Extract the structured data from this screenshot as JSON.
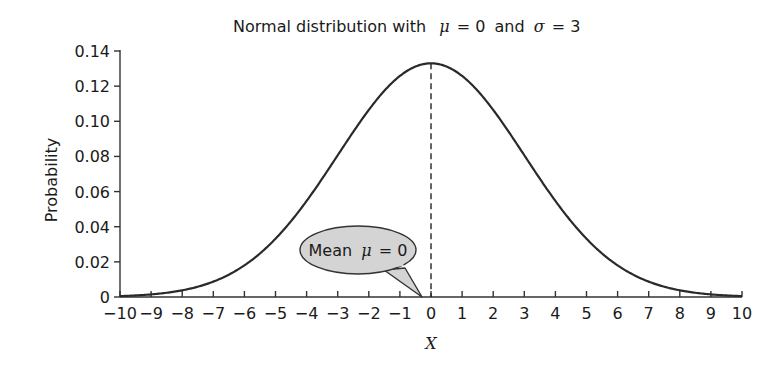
{
  "chart_data": {
    "type": "line",
    "title": "Normal distribution with  μ = 0 and σ = 3",
    "title_parts": {
      "prefix": "Normal distribution with",
      "mu_symbol": "μ",
      "mu_value": "= 0",
      "and": "and",
      "sigma_symbol": "σ",
      "sigma_value": "= 3"
    },
    "xlabel": "X",
    "ylabel": "Probability",
    "xlim": [
      -10,
      10
    ],
    "ylim": [
      0,
      0.14
    ],
    "mean": 0,
    "sd": 3,
    "x_ticks": [
      -10,
      -9,
      -8,
      -7,
      -6,
      -5,
      -4,
      -3,
      -2,
      -1,
      0,
      1,
      2,
      3,
      4,
      5,
      6,
      7,
      8,
      9,
      10
    ],
    "x_tick_labels": [
      "−10",
      "−9",
      "−8",
      "−7",
      "−6",
      "−5",
      "−4",
      "−3",
      "−2",
      "−1",
      "0",
      "1",
      "2",
      "3",
      "4",
      "5",
      "6",
      "7",
      "8",
      "9",
      "10"
    ],
    "y_ticks": [
      0,
      0.02,
      0.04,
      0.06,
      0.08,
      0.1,
      0.12,
      0.14
    ],
    "y_tick_labels": [
      "0",
      "0.02",
      "0.04",
      "0.06",
      "0.08",
      "0.10",
      "0.12",
      "0.14"
    ],
    "series": [
      {
        "name": "Normal PDF (μ=0, σ=3)",
        "x": [
          -10,
          -9,
          -8,
          -7,
          -6,
          -5,
          -4,
          -3,
          -2,
          -1,
          0,
          1,
          2,
          3,
          4,
          5,
          6,
          7,
          8,
          9,
          10
        ],
        "values": [
          0.0005,
          0.0015,
          0.0038,
          0.0088,
          0.018,
          0.0332,
          0.0547,
          0.0807,
          0.1065,
          0.1258,
          0.133,
          0.1258,
          0.1065,
          0.0807,
          0.0547,
          0.0332,
          0.018,
          0.0088,
          0.0038,
          0.0015,
          0.0005
        ]
      }
    ],
    "annotations": [
      {
        "type": "dashed-vertical-line",
        "x": 0,
        "label": "mean"
      },
      {
        "type": "callout",
        "text_prefix": "Mean",
        "mu_symbol": "μ",
        "text_value": "= 0",
        "points_to_x": 0
      }
    ],
    "grid": false,
    "legend": "none"
  }
}
